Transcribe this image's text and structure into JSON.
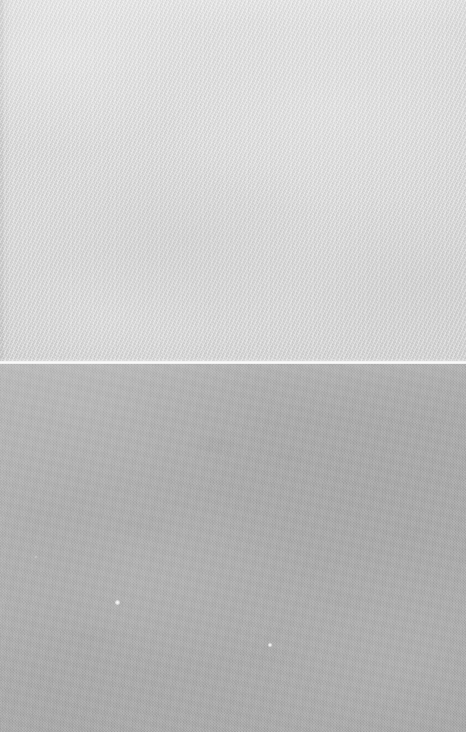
{
  "image": {
    "kind": "photograph",
    "subject": "close-up of two adjoining flat gray surfaces divided by a bright horizontal seam",
    "width_px": 466,
    "height_px": 732,
    "orientation": "portrait",
    "caption": "",
    "overlay_text": "",
    "visible_labels": []
  },
  "regions": [
    {
      "id": "upper",
      "name": "upper-light-gray-woven-fabric",
      "description": "Light gray textile with a fine diagonal twill weave and faint vertical warp ribbing",
      "bounds_px": {
        "x": 0,
        "y": 0,
        "width": 466,
        "height": 362
      },
      "base_color": "#d8d8d8",
      "highlight_color": "#e6e6e6",
      "shadow_color": "#c3c3c3",
      "texture": "diagonal twill weave",
      "weave_angle_deg": 115,
      "left_edge_shadow": true,
      "left_edge_width_px": 6,
      "text_content": ""
    },
    {
      "id": "seam",
      "name": "bright-horizontal-seam-line",
      "description": "Thin specular highlight line running the full width where the two surfaces meet",
      "bounds_px": {
        "x": 0,
        "y": 361,
        "width": 466,
        "height": 3
      },
      "base_color": "#fdfdfd",
      "text_content": ""
    },
    {
      "id": "lower",
      "name": "lower-medium-gray-matte-surface",
      "description": "Medium gray matte surface with fine even photographic grain and soft mottling",
      "bounds_px": {
        "x": 0,
        "y": 364,
        "width": 466,
        "height": 368
      },
      "base_color": "#ababab",
      "highlight_color": "#b8b8b8",
      "shadow_color": "#9e9e9e",
      "texture": "fine uniform grain",
      "text_content": ""
    }
  ],
  "specks": [
    {
      "name": "bright-speck-upper",
      "x": 117,
      "y": 602,
      "size_px": 5,
      "color": "#ffffff"
    },
    {
      "name": "bright-speck-lower",
      "x": 270,
      "y": 645,
      "size_px": 4,
      "color": "#ffffff"
    },
    {
      "name": "bright-speck-faint",
      "x": 36,
      "y": 557,
      "size_px": 2,
      "color": "#ffffff"
    }
  ],
  "palette": {
    "upper_gray": "#d8d8d8",
    "seam_white": "#fdfdfd",
    "lower_gray": "#ababab",
    "left_edge_gray": "#c2c2c2",
    "background": "#bdbdbd"
  }
}
